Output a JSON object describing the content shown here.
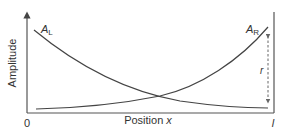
{
  "diagram": {
    "y_axis_label": "Amplitude",
    "x_axis_label_prefix": "Position ",
    "x_axis_label_var": "x",
    "x_origin_label": "0",
    "x_end_label": "l",
    "curve_left": {
      "label_main": "A",
      "label_sub": "L",
      "description": "decaying amplitude from left boundary"
    },
    "curve_right": {
      "label_main": "A",
      "label_sub": "R",
      "description": "growing amplitude toward right boundary"
    },
    "reflection_arrow_label": "r",
    "colors": {
      "axis": "#555555",
      "curve": "#444444",
      "text": "#333333",
      "dashed": "#666666"
    }
  }
}
